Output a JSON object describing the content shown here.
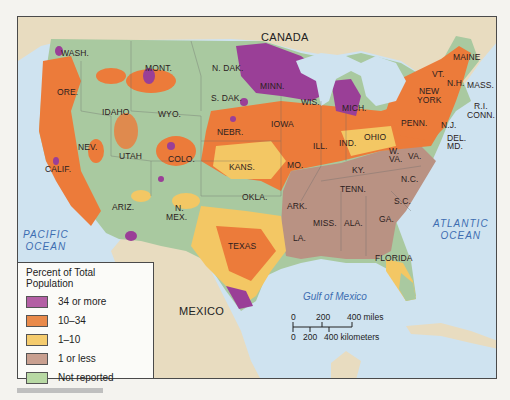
{
  "map": {
    "country_labels": [
      {
        "text": "CANADA",
        "x": 260,
        "y": 30
      },
      {
        "text": "MEXICO",
        "x": 178,
        "y": 304
      }
    ],
    "water_labels": [
      {
        "text": "PACIFIC\nOCEAN",
        "x": 22,
        "y": 228
      },
      {
        "text": "ATLANTIC\nOCEAN",
        "x": 432,
        "y": 217
      },
      {
        "text": "Gulf of Mexico",
        "x": 302,
        "y": 290
      }
    ],
    "state_labels": [
      {
        "text": "WASH.",
        "x": 60,
        "y": 52
      },
      {
        "text": "ORE.",
        "x": 56,
        "y": 91
      },
      {
        "text": "CALIF.",
        "x": 44,
        "y": 168
      },
      {
        "text": "NEV.",
        "x": 77,
        "y": 146
      },
      {
        "text": "IDAHO",
        "x": 101,
        "y": 111
      },
      {
        "text": "MONT.",
        "x": 144,
        "y": 67
      },
      {
        "text": "WYO.",
        "x": 157,
        "y": 113
      },
      {
        "text": "UTAH",
        "x": 118,
        "y": 155
      },
      {
        "text": "COLO.",
        "x": 167,
        "y": 158
      },
      {
        "text": "ARIZ.",
        "x": 111,
        "y": 206
      },
      {
        "text": "N.",
        "x": 174,
        "y": 207
      },
      {
        "text": "MEX.",
        "x": 165,
        "y": 216
      },
      {
        "text": "N. DAK.",
        "x": 211,
        "y": 67
      },
      {
        "text": "S. DAK.",
        "x": 210,
        "y": 97
      },
      {
        "text": "NEBR.",
        "x": 216,
        "y": 131
      },
      {
        "text": "KANS.",
        "x": 228,
        "y": 166
      },
      {
        "text": "OKLA.",
        "x": 241,
        "y": 196
      },
      {
        "text": "TEXAS",
        "x": 227,
        "y": 245
      },
      {
        "text": "MINN.",
        "x": 259,
        "y": 85
      },
      {
        "text": "IOWA",
        "x": 270,
        "y": 123
      },
      {
        "text": "MO.",
        "x": 286,
        "y": 164
      },
      {
        "text": "ARK.",
        "x": 286,
        "y": 205
      },
      {
        "text": "LA.",
        "x": 292,
        "y": 237
      },
      {
        "text": "WIS.",
        "x": 300,
        "y": 101
      },
      {
        "text": "ILL.",
        "x": 312,
        "y": 145
      },
      {
        "text": "MICH.",
        "x": 341,
        "y": 107
      },
      {
        "text": "IND.",
        "x": 338,
        "y": 142
      },
      {
        "text": "OHIO",
        "x": 363,
        "y": 136
      },
      {
        "text": "KY.",
        "x": 351,
        "y": 169
      },
      {
        "text": "TENN.",
        "x": 339,
        "y": 188
      },
      {
        "text": "MISS.",
        "x": 312,
        "y": 222
      },
      {
        "text": "ALA.",
        "x": 343,
        "y": 222
      },
      {
        "text": "GA.",
        "x": 378,
        "y": 218
      },
      {
        "text": "FLORIDA",
        "x": 374,
        "y": 257
      },
      {
        "text": "S.C.",
        "x": 393,
        "y": 200
      },
      {
        "text": "N.C.",
        "x": 400,
        "y": 178
      },
      {
        "text": "VA.",
        "x": 407,
        "y": 155
      },
      {
        "text": "W.",
        "x": 388,
        "y": 150
      },
      {
        "text": "VA.",
        "x": 388,
        "y": 158
      },
      {
        "text": "PENN.",
        "x": 400,
        "y": 122
      },
      {
        "text": "NEW",
        "x": 418,
        "y": 90
      },
      {
        "text": "YORK",
        "x": 416,
        "y": 99
      },
      {
        "text": "VT.",
        "x": 431,
        "y": 73
      },
      {
        "text": "N.H.",
        "x": 446,
        "y": 82
      },
      {
        "text": "MAINE",
        "x": 452,
        "y": 56
      },
      {
        "text": "MASS.",
        "x": 466,
        "y": 84
      },
      {
        "text": "R.I.",
        "x": 473,
        "y": 105
      },
      {
        "text": "CONN.",
        "x": 466,
        "y": 114
      },
      {
        "text": "N.J.",
        "x": 440,
        "y": 124
      },
      {
        "text": "DEL.",
        "x": 446,
        "y": 137
      },
      {
        "text": "MD.",
        "x": 446,
        "y": 145
      }
    ]
  },
  "legend": {
    "title": "Percent of Total Population",
    "items": [
      {
        "label": "34 or more",
        "color": "#b35fa4"
      },
      {
        "label": "10–34",
        "color": "#e98a4a"
      },
      {
        "label": "1–10",
        "color": "#f5cc6e"
      },
      {
        "label": "1 or less",
        "color": "#c9a090"
      },
      {
        "label": "Not reported",
        "color": "#b8d9a4"
      }
    ]
  },
  "scale_bar": {
    "miles_ticks": [
      "0",
      "200",
      "400 miles"
    ],
    "km_ticks": [
      "0",
      "200",
      "400 kilometers"
    ]
  },
  "colors": {
    "water": "#cfe3f0",
    "land_foreign": "#e8dcc0",
    "purple": "#9a3f97",
    "orange": "#ec7b3a",
    "yellow": "#f3c764",
    "brown": "#b99283",
    "green": "#a9c9a0"
  }
}
